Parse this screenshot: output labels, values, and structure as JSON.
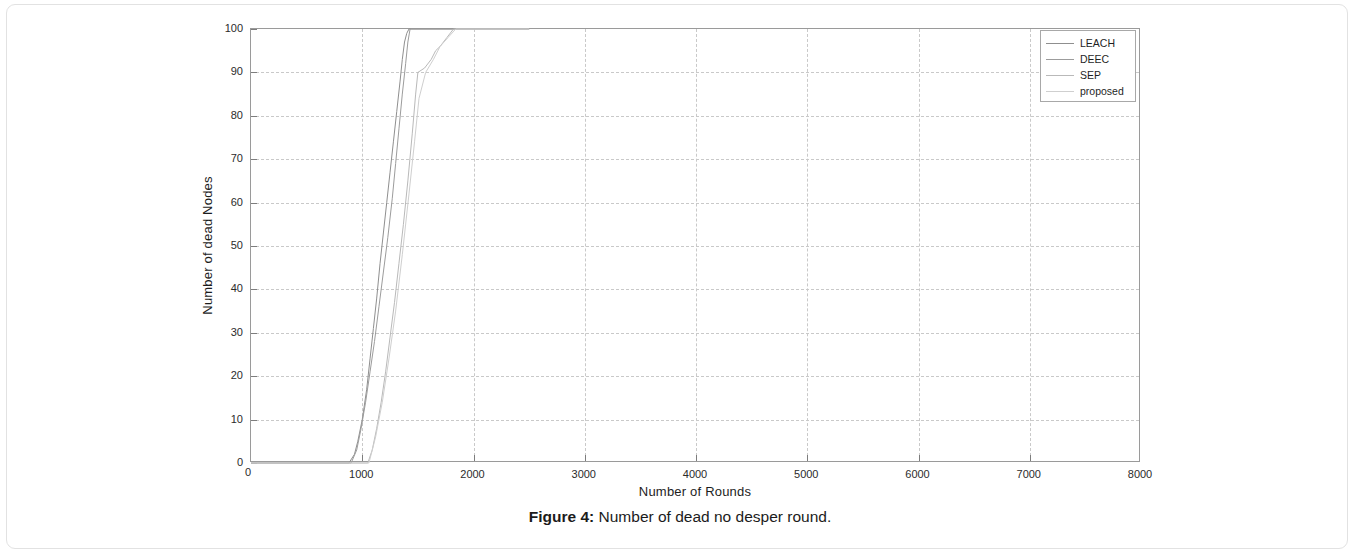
{
  "caption": {
    "prefix": "Figure 4:",
    "text": " Number of dead no desper round."
  },
  "chart_data": {
    "type": "line",
    "title": "",
    "xlabel": "Number of Rounds",
    "ylabel": "Number of dead Nodes",
    "xlim": [
      0,
      8000
    ],
    "ylim": [
      0,
      100
    ],
    "xticks": [
      0,
      1000,
      2000,
      3000,
      4000,
      5000,
      6000,
      7000,
      8000
    ],
    "yticks": [
      0,
      10,
      20,
      30,
      40,
      50,
      60,
      70,
      80,
      90,
      100
    ],
    "grid": true,
    "legend_position": "top-right",
    "legend": [
      "LEACH",
      "DEEC",
      "SEP",
      "proposed"
    ],
    "colors": {
      "LEACH": "#8f8f8f",
      "DEEC": "#9c9c9c",
      "SEP": "#b9b9b9",
      "proposed": "#cfcfcf"
    },
    "series": [
      {
        "name": "LEACH",
        "color": "#8f8f8f",
        "x": [
          0,
          880,
          930,
          960,
          1000,
          1040,
          1070,
          1100,
          1130,
          1160,
          1190,
          1220,
          1250,
          1280,
          1310,
          1340,
          1360,
          1380,
          1400,
          1420,
          2500
        ],
        "y": [
          0,
          0,
          2,
          5,
          10,
          17,
          24,
          31,
          38,
          46,
          53,
          60,
          67,
          74,
          81,
          88,
          93,
          97,
          99,
          100,
          100
        ]
      },
      {
        "name": "DEEC",
        "color": "#9c9c9c",
        "x": [
          0,
          900,
          950,
          990,
          1030,
          1070,
          1110,
          1150,
          1190,
          1230,
          1270,
          1300,
          1330,
          1360,
          1390,
          1410,
          1430,
          2500
        ],
        "y": [
          0,
          0,
          3,
          8,
          14,
          21,
          28,
          36,
          44,
          52,
          61,
          69,
          77,
          85,
          92,
          97,
          100,
          100
        ]
      },
      {
        "name": "SEP",
        "color": "#b9b9b9",
        "x": [
          0,
          1050,
          1090,
          1130,
          1170,
          1210,
          1250,
          1290,
          1330,
          1370,
          1410,
          1450,
          1480,
          1500,
          1560,
          1620,
          1660,
          1700,
          1760,
          1820,
          2500
        ],
        "y": [
          0,
          0,
          3,
          8,
          14,
          21,
          29,
          37,
          46,
          55,
          65,
          76,
          85,
          90,
          91,
          93,
          95,
          96,
          98,
          100,
          100
        ]
      },
      {
        "name": "proposed",
        "color": "#cfcfcf",
        "x": [
          0,
          1060,
          1120,
          1180,
          1240,
          1300,
          1360,
          1420,
          1470,
          1510,
          1570,
          1640,
          1700,
          1770,
          1840,
          2500
        ],
        "y": [
          0,
          0,
          6,
          14,
          24,
          35,
          48,
          62,
          74,
          84,
          90,
          93,
          96,
          98,
          100,
          100
        ]
      }
    ]
  }
}
